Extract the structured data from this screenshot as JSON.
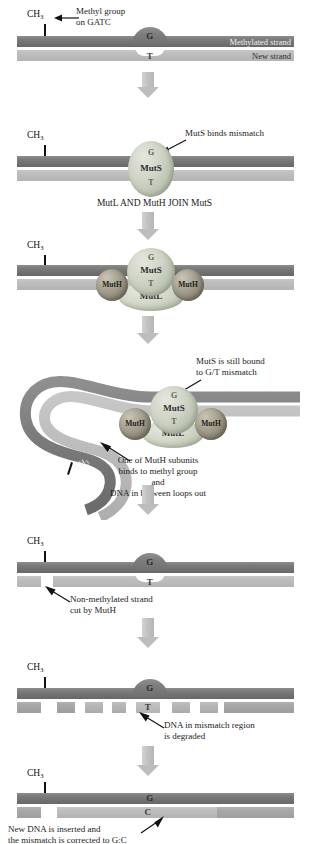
{
  "figure": {
    "type": "biological-process-diagram",
    "background_color": "#ffffff",
    "colors": {
      "methylated_strand": "#757575",
      "new_strand": "#bdbdbd",
      "muts_protein": "#c6ccbb",
      "mutl_protein": "#d0d5c6",
      "muth_protein": "#9b9484",
      "arrow": "#bdbdbd",
      "text": "#1a1a1a"
    }
  },
  "panels": [
    {
      "id": "panel-1",
      "name": "mismatch-present",
      "labels": {
        "methyl_group": "Methyl group\non GATC",
        "methyl_tag": "CH",
        "methyl_sub": "3",
        "methylated_strand": "Methylated strand",
        "new_strand": "New strand"
      },
      "bases": {
        "top": "G",
        "bottom": "T"
      }
    },
    {
      "id": "panel-2",
      "name": "muts-binds-mismatch",
      "labels": {
        "methyl_tag": "CH",
        "methyl_sub": "3",
        "annotation": "MutS binds mismatch"
      },
      "proteins": [
        {
          "name": "MutS",
          "label": "MutS"
        }
      ],
      "bases": {
        "top": "G",
        "bottom": "T"
      }
    },
    {
      "id": "transition-1",
      "name": "mutl-muth-join",
      "text": "MutL AND MutH JOIN MutS"
    },
    {
      "id": "panel-3",
      "name": "complex-assembled",
      "labels": {
        "methyl_tag": "CH",
        "methyl_sub": "3"
      },
      "proteins": [
        {
          "name": "MutS",
          "label": "MutS"
        },
        {
          "name": "MutL",
          "label": "MutL"
        },
        {
          "name": "MutH-left",
          "label": "MutH"
        },
        {
          "name": "MutH-right",
          "label": "MutH"
        }
      ],
      "bases": {
        "top": "G",
        "bottom": "T"
      }
    },
    {
      "id": "panel-4",
      "name": "dna-loops-out",
      "labels": {
        "methyl_tag": "CH",
        "methyl_sub": "3",
        "annotation_top": "MutS is still bound\nto G/T mismatch",
        "annotation_bottom": "One of MutH subunits\nbinds to methyl group\nand\nDNA in between loops out"
      },
      "proteins": [
        {
          "name": "MutS",
          "label": "MutS"
        },
        {
          "name": "MutL",
          "label": "MutL"
        },
        {
          "name": "MutH-left",
          "label": "MutH"
        },
        {
          "name": "MutH-right",
          "label": "MutH"
        }
      ],
      "bases": {
        "top": "G",
        "bottom": "T"
      }
    },
    {
      "id": "panel-5",
      "name": "strand-cut",
      "labels": {
        "methyl_tag": "CH",
        "methyl_sub": "3",
        "annotation": "Non-methylated strand\ncut by MutH"
      },
      "bases": {
        "top": "G",
        "bottom": "T"
      }
    },
    {
      "id": "panel-6",
      "name": "strand-degraded",
      "labels": {
        "methyl_tag": "CH",
        "methyl_sub": "3",
        "annotation": "DNA in mismatch region\nis degraded"
      },
      "bases": {
        "top": "G",
        "bottom": "T"
      }
    },
    {
      "id": "panel-7",
      "name": "repair-complete",
      "labels": {
        "methyl_tag": "CH",
        "methyl_sub": "3",
        "annotation": "New DNA is inserted and\nthe mismatch is corrected to G:C"
      },
      "bases": {
        "top": "G",
        "bottom": "C"
      }
    }
  ]
}
